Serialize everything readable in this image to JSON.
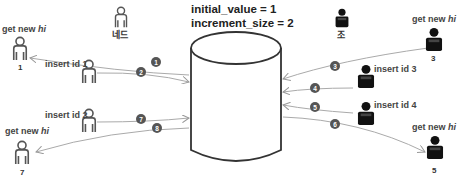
{
  "config": {
    "initial_value": "initial_value = 1",
    "increment_size": "increment_size = 2"
  },
  "roles": {
    "left": "네드",
    "right": "조"
  },
  "left_actors": [
    {
      "label": "get new",
      "label_em": "hi",
      "value": "1"
    },
    {
      "label": "insert id 1"
    },
    {
      "label": "insert id 2"
    },
    {
      "label": "get new",
      "label_em": "hi",
      "value": "7"
    }
  ],
  "right_actors": [
    {
      "label": "get new",
      "label_em": "hi",
      "value": "3"
    },
    {
      "label": "insert id 3"
    },
    {
      "label": "insert id 4"
    },
    {
      "label": "get new",
      "label_em": "hi",
      "value": "5"
    }
  ],
  "steps": [
    "1",
    "2",
    "3",
    "4",
    "5",
    "6",
    "7",
    "8"
  ],
  "colors": {
    "outline_person": "#555555",
    "dark_person": "#111111",
    "arrow": "#aaaaaa",
    "step_badge": "#555555",
    "cylinder": "#333333"
  }
}
